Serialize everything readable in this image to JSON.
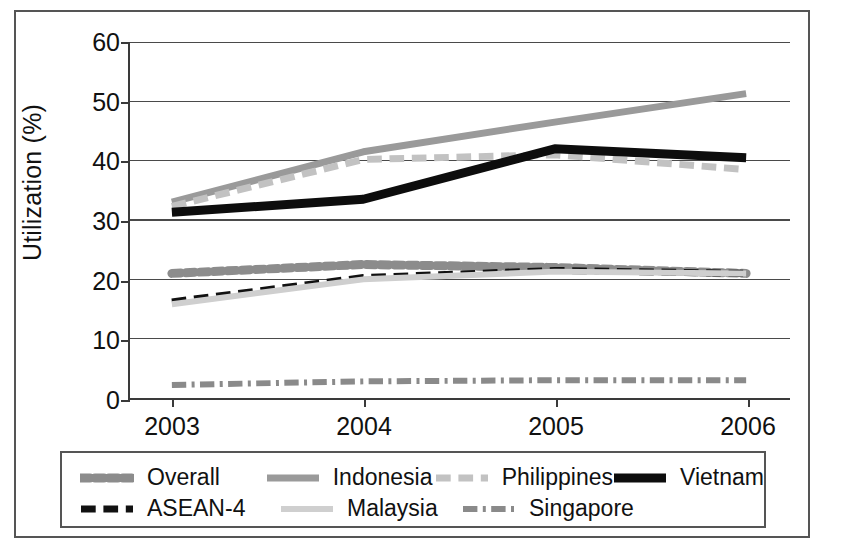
{
  "chart_data": {
    "type": "line",
    "title": "",
    "xlabel": "",
    "ylabel": "Utilization (%)",
    "x": [
      "2003",
      "2004",
      "2005",
      "2006"
    ],
    "categories": [
      "2003",
      "2004",
      "2005",
      "2006"
    ],
    "ylim": [
      0,
      60
    ],
    "yticks": [
      0,
      10,
      20,
      30,
      40,
      50,
      60
    ],
    "ytick_labels": [
      "0",
      "10",
      "20",
      "30",
      "40",
      "50",
      "60"
    ],
    "grid": true,
    "grid_axis": "y",
    "legend_position": "bottom",
    "series": [
      {
        "name": "Overall",
        "values": [
          21.0,
          22.5,
          22.0,
          21.0
        ],
        "color": "#8c8c8c",
        "style": "dotted",
        "width": 9
      },
      {
        "name": "ASEAN-4",
        "values": [
          16.2,
          20.3,
          21.5,
          21.0
        ],
        "color": "#111111",
        "style": "dashed",
        "width": 7
      },
      {
        "name": "Indonesia",
        "values": [
          33.0,
          41.5,
          46.5,
          51.3
        ],
        "color": "#9a9a9a",
        "style": "solid",
        "width": 7
      },
      {
        "name": "Malaysia",
        "values": [
          15.8,
          20.0,
          21.3,
          21.0
        ],
        "color": "#cfcfcf",
        "style": "solid",
        "width": 6
      },
      {
        "name": "Philippines",
        "values": [
          32.3,
          40.2,
          41.0,
          38.5
        ],
        "color": "#c2c2c2",
        "style": "dashed",
        "width": 7
      },
      {
        "name": "Singapore",
        "values": [
          2.2,
          2.8,
          3.0,
          3.0
        ],
        "color": "#8a8a8a",
        "style": "dashdot",
        "width": 6
      },
      {
        "name": "Vietnam",
        "values": [
          31.3,
          33.5,
          42.0,
          40.5
        ],
        "color": "#0d0d0d",
        "style": "solid",
        "width": 9
      }
    ]
  },
  "axes": {
    "y_title": "Utilization (%)"
  },
  "legend": {
    "rows": [
      [
        {
          "label": "Overall",
          "series": "Overall"
        },
        {
          "label": "Indonesia",
          "series": "Indonesia"
        },
        {
          "label": "Philippines",
          "series": "Philippines"
        },
        {
          "label": "Vietnam",
          "series": "Vietnam"
        }
      ],
      [
        {
          "label": "ASEAN-4",
          "series": "ASEAN-4"
        },
        {
          "label": "Malaysia",
          "series": "Malaysia"
        },
        {
          "label": "Singapore",
          "series": "Singapore"
        }
      ]
    ]
  }
}
